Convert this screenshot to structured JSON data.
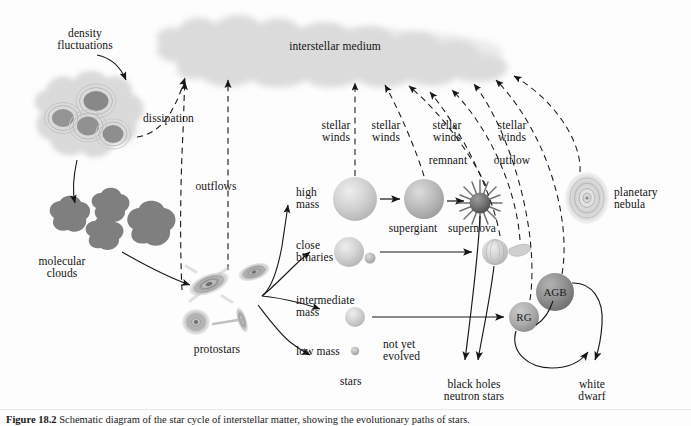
{
  "figure": {
    "caption_label": "Figure 18.2",
    "caption_text": "Schematic diagram of the star cycle of interstellar matter, showing the evolutionary paths of stars."
  },
  "colors": {
    "cloud_fill": "#d8d8d8",
    "molecular_clump": "#8f8f8f",
    "star_light": "#cfcfcf",
    "star_mid": "#b8b8b8",
    "star_dark": "#6a6a6a",
    "agb_fill": "#8e8e8e",
    "rg_fill": "#a8a8a8",
    "line": "#1a1a1a",
    "text": "#131313"
  },
  "labels": {
    "interstellar_medium": "interstellar medium",
    "density_fluctuations_l1": "density",
    "density_fluctuations_l2": "fluctuations",
    "dissipation": "dissipation",
    "outflows": "outflows",
    "molecular_clouds_l1": "molecular",
    "molecular_clouds_l2": "clouds",
    "protostars": "protostars",
    "high_mass_l1": "high",
    "high_mass_l2": "mass",
    "close_binaries_l1": "close",
    "close_binaries_l2": "binaries",
    "intermediate_mass_l1": "intermediate",
    "intermediate_mass_l2": "mass",
    "low_mass": "low mass",
    "stars": "stars",
    "not_yet_evolved_l1": "not yet",
    "not_yet_evolved_l2": "evolved",
    "supergiant": "supergiant",
    "supernova": "supernova",
    "remnant": "remnant",
    "outflow": "outflow",
    "stellar_winds_1_l1": "stellar",
    "stellar_winds_1_l2": "winds",
    "stellar_winds_2_l1": "stellar",
    "stellar_winds_2_l2": "winds",
    "stellar_winds_3_l1": "stellar",
    "stellar_winds_3_l2": "winds",
    "stellar_winds_4_l1": "stellar",
    "stellar_winds_4_l2": "winds",
    "planetary_nebula_l1": "planetary",
    "planetary_nebula_l2": "nebula",
    "agb": "AGB",
    "rg": "RG",
    "black_holes_l1": "black holes",
    "black_holes_l2": "neutron stars",
    "white_dwarf_l1": "white",
    "white_dwarf_l2": "dwarf"
  },
  "nodes": {
    "interstellar_medium_cloud": "cloud-shape",
    "density_fluctuation_cloud": "clumpy-cloud-shape",
    "molecular_clouds": "four-dark-blobs",
    "protostar_disks": "three-accretion-disks",
    "high_mass_star": "large-sphere",
    "close_binary_pair": "large-sphere-with-small-companion",
    "intermediate_mass_star": "medium-sphere",
    "low_mass_star": "tiny-sphere",
    "supergiant_star": "large-sphere",
    "supernova_star": "dark-sphere-with-spikes",
    "mass_transfer_binary": "sphere-with-teardrop-stream",
    "planetary_nebula_ring": "elliptical-ring",
    "agb_star": "dark-sphere",
    "rg_star": "mid-sphere"
  }
}
